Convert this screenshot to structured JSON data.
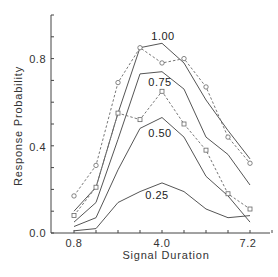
{
  "chart_data": {
    "type": "line",
    "title": "",
    "xlabel": "Signal Duration",
    "ylabel": "Response Probability",
    "x": [
      0.8,
      1.6,
      2.4,
      3.2,
      4.0,
      4.8,
      5.6,
      6.4,
      7.2
    ],
    "xticks_labeled": [
      "0.8",
      "4.0",
      "7.2"
    ],
    "yticks_labeled": [
      "0.0",
      "0.4",
      "0.8"
    ],
    "xlim": [
      0.0,
      8.0
    ],
    "ylim": [
      0.0,
      1.0
    ],
    "grid": false,
    "legend": "inline curve labels",
    "series": [
      {
        "name": "1.00",
        "style": "solid",
        "values": [
          0.1,
          0.21,
          0.55,
          0.85,
          0.87,
          0.78,
          0.61,
          0.47,
          0.34
        ]
      },
      {
        "name": "0.75",
        "style": "solid",
        "values": [
          0.05,
          0.14,
          0.43,
          0.73,
          0.74,
          0.66,
          0.44,
          0.36,
          0.22
        ]
      },
      {
        "name": "0.50",
        "style": "solid",
        "values": [
          0.03,
          0.07,
          0.29,
          0.48,
          0.53,
          0.44,
          0.26,
          0.17,
          0.05
        ]
      },
      {
        "name": "0.25",
        "style": "solid",
        "values": [
          0.01,
          0.02,
          0.14,
          0.19,
          0.23,
          0.19,
          0.11,
          0.07,
          0.08
        ]
      },
      {
        "name": "observed (circles)",
        "style": "dashed-circle",
        "values": [
          0.17,
          0.31,
          0.69,
          0.85,
          0.78,
          0.8,
          0.67,
          0.44,
          0.32
        ]
      },
      {
        "name": "observed (squares)",
        "style": "dashed-square",
        "values": [
          0.08,
          0.21,
          0.55,
          0.52,
          0.65,
          0.5,
          0.38,
          0.18,
          0.11
        ]
      }
    ]
  },
  "labels": {
    "xlabel": "Signal Duration",
    "ylabel": "Response Probability",
    "curve_100": "1.00",
    "curve_075": "0.75",
    "curve_050": "0.50",
    "curve_025": "0.25",
    "xt_08": "0.8",
    "xt_40": "4.0",
    "xt_72": "7.2",
    "yt_00": "0.0",
    "yt_04": "0.4",
    "yt_08": "0.8"
  }
}
